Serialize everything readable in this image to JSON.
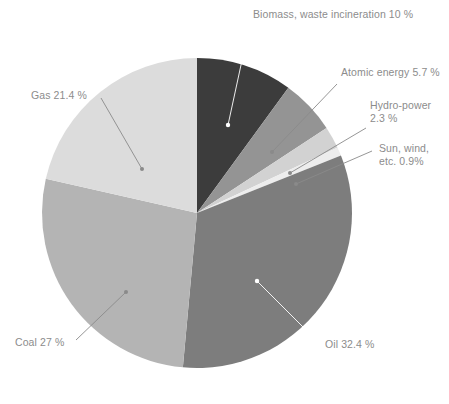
{
  "chart_data": {
    "type": "pie",
    "title": "",
    "subtitle": "",
    "xlabel": "",
    "ylabel": "",
    "legend_position": "none",
    "grid": false,
    "units": "%",
    "start_angle_deg": 0,
    "direction": "clockwise",
    "categories": [
      "Biomass, waste incineration",
      "Atomic energy",
      "Hydro-power",
      "Sun, wind, etc.",
      "Oil",
      "Coal",
      "Gas"
    ],
    "values": [
      10,
      5.7,
      2.3,
      0.9,
      32.4,
      27,
      21.4
    ],
    "colors": [
      "#3c3c3c",
      "#949494",
      "#d2d2d2",
      "#ededed",
      "#7d7d7d",
      "#b4b4b4",
      "#dcdcdc"
    ],
    "slices": [
      {
        "label": "Biomass, waste incineration",
        "value": 10,
        "value_text": "10 %",
        "color": "#3c3c3c"
      },
      {
        "label": "Atomic energy",
        "value": 5.7,
        "value_text": "5.7 %",
        "color": "#949494"
      },
      {
        "label": "Hydro-power",
        "value": 2.3,
        "value_text": "2.3 %",
        "color": "#d2d2d2"
      },
      {
        "label": "Sun, wind, etc.",
        "value": 0.9,
        "value_text": "0.9 %",
        "color": "#ededed"
      },
      {
        "label": "Oil",
        "value": 32.4,
        "value_text": "32.4 %",
        "color": "#7d7d7d"
      },
      {
        "label": "Coal",
        "value": 27,
        "value_text": "27 %",
        "color": "#b4b4b4"
      },
      {
        "label": "Gas",
        "value": 21.4,
        "value_text": "21.4 %",
        "color": "#dcdcdc"
      }
    ]
  },
  "labels": {
    "biomass": "Biomass, waste incineration 10 %",
    "atomic": "Atomic energy 5.7 %",
    "hydro": "Hydro-power\n2.3 %",
    "sunwind": "Sun, wind,\netc. 0.9%",
    "gas": "Gas 21.4 %",
    "coal": "Coal 27 %",
    "oil": "Oil 32.4 %"
  },
  "style": {
    "label_color": "#8c8c8c",
    "leader_line_color": "#8a8a8a",
    "background": "#ffffff"
  }
}
